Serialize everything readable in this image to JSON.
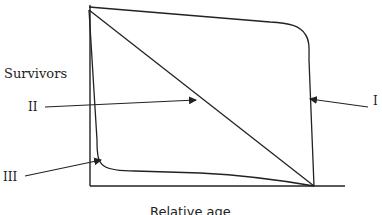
{
  "diagram": {
    "axes": {
      "y_label": "Survivors",
      "x_label": "Relative age"
    },
    "curves": [
      {
        "id": "I",
        "label": "I",
        "shape": "convex (high survival until old age, then sharp drop)"
      },
      {
        "id": "II",
        "label": "II",
        "shape": "straight diagonal (constant mortality)"
      },
      {
        "id": "III",
        "label": "III",
        "shape": "concave (high early mortality, then flat)"
      }
    ],
    "colors": {
      "line": "#222222",
      "background": "#ffffff"
    }
  }
}
